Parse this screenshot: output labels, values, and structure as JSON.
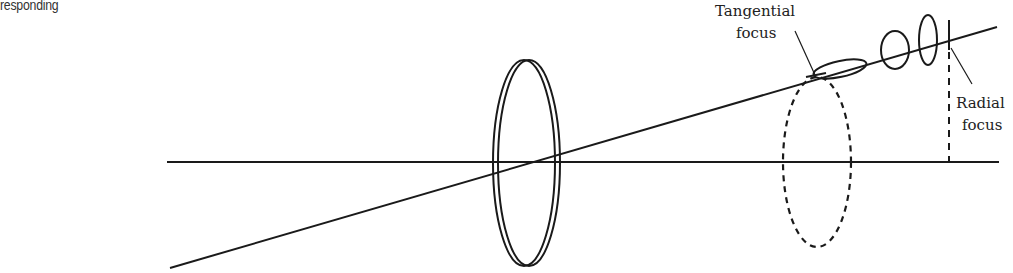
{
  "caption_fragment": "responding",
  "diagram": {
    "labels": {
      "tangential_line1": "Tangential",
      "tangential_line2": "focus",
      "radial_line1": "Radial",
      "radial_line2": "focus"
    },
    "elements": [
      "optical-axis",
      "oblique-ray",
      "lens",
      "tangential-focal-line",
      "circle-of-least-confusion",
      "elliptical-cross-sections",
      "radial-focal-line",
      "dashed-pupil-ellipse"
    ],
    "colors": {
      "stroke": "#1a1a1a",
      "text": "#222222",
      "background": "#ffffff"
    }
  }
}
